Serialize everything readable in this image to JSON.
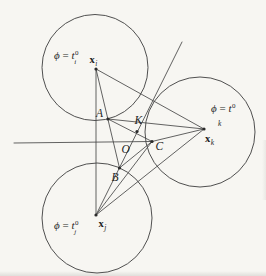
{
  "figure": {
    "name": "front-propagation-geometry-diagram",
    "width": 266,
    "height": 276,
    "background": "#f7f6f2",
    "line_color": "#474747",
    "dot_color": "#2a2a2a",
    "text_color": "#1e1e1e",
    "circles": [
      {
        "id": "support-circle-i",
        "cx": 95,
        "cy": 67.5,
        "r": 53
      },
      {
        "id": "support-circle-j",
        "cx": 97,
        "cy": 218,
        "r": 55
      },
      {
        "id": "support-circle-k",
        "cx": 200,
        "cy": 132,
        "r": 55
      }
    ],
    "segments": [
      {
        "id": "front-line-horizontal",
        "x1": 14,
        "y1": 143,
        "x2": 152,
        "y2": 141.5
      },
      {
        "id": "edge-xi-xj",
        "x1": 96,
        "y1": 69,
        "x2": 96,
        "y2": 215
      },
      {
        "id": "edge-xi-xk",
        "x1": 96,
        "y1": 69,
        "x2": 204,
        "y2": 129
      },
      {
        "id": "edge-xj-xk",
        "x1": 96,
        "y1": 215,
        "x2": 204,
        "y2": 129
      },
      {
        "id": "line-xi-A-B",
        "x1": 96,
        "y1": 69,
        "x2": 119.5,
        "y2": 168
      },
      {
        "id": "ray-xj-B-K",
        "x1": 96,
        "y1": 215,
        "x2": 182,
        "y2": 42
      },
      {
        "id": "line-A-K-C",
        "x1": 108,
        "y1": 119,
        "x2": 152,
        "y2": 141.5
      },
      {
        "id": "line-A-xk",
        "x1": 108,
        "y1": 119,
        "x2": 204,
        "y2": 129
      },
      {
        "id": "line-B-C",
        "x1": 119.5,
        "y1": 168,
        "x2": 152,
        "y2": 141.5
      },
      {
        "id": "line-C-xk",
        "x1": 152,
        "y1": 141.5,
        "x2": 204,
        "y2": 129
      },
      {
        "id": "line-xj-C",
        "x1": 96,
        "y1": 215,
        "x2": 152,
        "y2": 141.5
      }
    ],
    "nodes": [
      {
        "id": "node-xi",
        "x": 96,
        "y": 69
      },
      {
        "id": "node-xj",
        "x": 96,
        "y": 215
      },
      {
        "id": "node-xk",
        "x": 204,
        "y": 129
      },
      {
        "id": "point-A",
        "x": 108,
        "y": 119
      },
      {
        "id": "point-B",
        "x": 119.5,
        "y": 168
      },
      {
        "id": "point-K",
        "x": 137,
        "y": 131.5
      },
      {
        "id": "point-C",
        "x": 152,
        "y": 141.5
      }
    ],
    "point_labels": [
      {
        "id": "label-A",
        "text": "A",
        "x": 96,
        "y": 117
      },
      {
        "id": "label-K",
        "text": "K",
        "x": 134.5,
        "y": 124
      },
      {
        "id": "label-O",
        "text": "O",
        "x": 121.5,
        "y": 152.5
      },
      {
        "id": "label-C",
        "text": "C",
        "x": 155.5,
        "y": 149.5
      },
      {
        "id": "label-B",
        "text": "B",
        "x": 111.5,
        "y": 181
      }
    ],
    "vector_labels": [
      {
        "id": "label-x-i",
        "base": "x",
        "sub": "i",
        "x": 89.5,
        "y": 63
      },
      {
        "id": "label-x-j",
        "base": "x",
        "sub": "j",
        "x": 98.5,
        "y": 227
      },
      {
        "id": "label-x-k",
        "base": "x",
        "sub": "k",
        "x": 205,
        "y": 142
      }
    ],
    "contour_labels": [
      {
        "id": "label-phi-i",
        "phi": "ϕ",
        "eq": " = ",
        "base": "t",
        "sup": "0",
        "sub": "i",
        "x": 54,
        "y": 59,
        "layout": "stacked"
      },
      {
        "id": "label-phi-k",
        "phi": "ϕ",
        "eq": " = ",
        "base": "t",
        "sup": "0",
        "sub": "k",
        "x": 211,
        "y": 112,
        "layout": "below",
        "sub_x": 218,
        "sub_y": 126
      },
      {
        "id": "label-phi-j",
        "phi": "ϕ",
        "eq": " = ",
        "base": "t",
        "sup": "0",
        "sub": "j",
        "x": 54,
        "y": 229,
        "layout": "stacked"
      }
    ]
  }
}
